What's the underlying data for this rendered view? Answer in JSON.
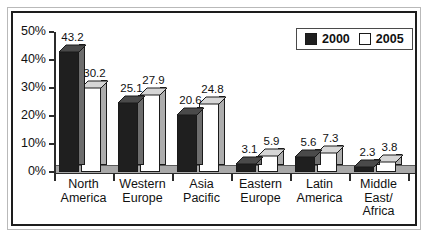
{
  "chart_data": {
    "type": "bar",
    "title": "",
    "xlabel": "",
    "ylabel": "",
    "ylim": [
      0,
      50
    ],
    "grid": false,
    "legend_position": "top-right",
    "y_ticks": [
      "0%",
      "10%",
      "20%",
      "30%",
      "40%",
      "50%"
    ],
    "categories": [
      "North\nAmerica",
      "Western\nEurope",
      "Asia\nPacific",
      "Eastern\nEurope",
      "Latin\nAmerica",
      "Middle\nEast/\nAfrica"
    ],
    "category_lines": [
      [
        "North",
        "America"
      ],
      [
        "Western",
        "Europe"
      ],
      [
        "Asia",
        "Pacific"
      ],
      [
        "Eastern",
        "Europe"
      ],
      [
        "Latin",
        "America"
      ],
      [
        "Middle",
        "East/",
        "Africa"
      ]
    ],
    "series": [
      {
        "name": "2000",
        "color": "#1f1f1f",
        "values": [
          43.2,
          25.1,
          20.6,
          3.1,
          5.6,
          2.3
        ]
      },
      {
        "name": "2005",
        "color": "#ffffff",
        "values": [
          30.2,
          27.9,
          24.8,
          5.9,
          7.3,
          3.8
        ]
      }
    ]
  },
  "legend": {
    "entries": [
      {
        "label": "2000",
        "swatch": "dark"
      },
      {
        "label": "2005",
        "swatch": "light"
      }
    ]
  }
}
